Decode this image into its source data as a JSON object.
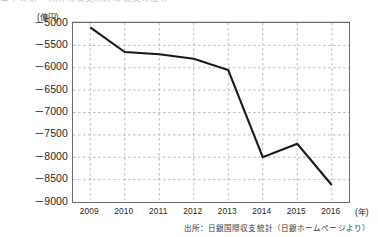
{
  "figure": {
    "title_cropped": "日本の第一次所得収支以外の収支の推移",
    "unit_label": "(億円)",
    "xaxis_unit": "(年)",
    "source_note": "出所：日銀国際収支統計（日銀ホームページより）",
    "line_color": "#1a1718",
    "grid_color": "#b9b6b7",
    "frame_color": "#6d6a6b"
  },
  "chart_data": {
    "type": "line",
    "title": "日本の第一次所得収支以外の収支の推移",
    "xlabel": "(年)",
    "ylabel": "(億円)",
    "categories": [
      "2009",
      "2010",
      "2011",
      "2012",
      "2013",
      "2014",
      "2015",
      "2016"
    ],
    "x": [
      2009,
      2010,
      2011,
      2012,
      2013,
      2014,
      2015,
      2016
    ],
    "series": [
      {
        "name": "収支",
        "values": [
          -5100,
          -5650,
          -5700,
          -5800,
          -6050,
          -8000,
          -7700,
          -8620
        ]
      }
    ],
    "ylim": [
      -9000,
      -5000
    ],
    "yticks": [
      -5000,
      -5500,
      -6000,
      -6500,
      -7000,
      -7500,
      -8000,
      -8500,
      -9000
    ],
    "ytick_labels": [
      "－5000",
      "－5500",
      "－6000",
      "－6500",
      "－7000",
      "－7500",
      "－8000",
      "－8500",
      "－9000"
    ],
    "xticks": [
      2009,
      2010,
      2011,
      2012,
      2013,
      2014,
      2015,
      2016
    ],
    "grid": true,
    "grid_style": "dashed",
    "legend": null,
    "legend_position": "none",
    "annotations": [
      "出所：日銀国際収支統計（日銀ホームページより）"
    ]
  }
}
